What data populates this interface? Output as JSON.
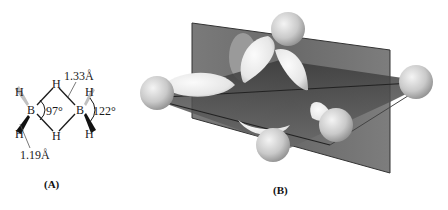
{
  "panel_a": {
    "caption": "(A)",
    "atoms": {
      "boron_left": "B",
      "boron_right": "B",
      "h_bridge_top": "H",
      "h_bridge_bottom": "H",
      "h_term_left_top": "H",
      "h_term_left_bottom": "H",
      "h_term_right_top": "H",
      "h_term_right_bottom": "H"
    },
    "measurements": {
      "bridge_bond_length": "1.33Å",
      "terminal_bond_length": "1.19Å",
      "bridge_angle": "97°",
      "terminal_angle": "122°"
    }
  },
  "panel_b": {
    "caption": "(B)"
  },
  "colors": {
    "plane": "#6b6b6b",
    "plane_dark": "#3f3f3f",
    "lobe": "#ececec",
    "sphere": "#c8c8c8"
  }
}
